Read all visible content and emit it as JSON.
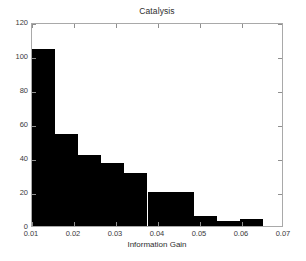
{
  "chart_data": {
    "type": "bar",
    "title": "Catalysis",
    "subtitle": "",
    "xlabel": "Information Gain",
    "ylabel": "",
    "grid": false,
    "legend": null,
    "legend_position": "none",
    "xlim": [
      0.01,
      0.07
    ],
    "ylim": [
      0,
      120
    ],
    "xticks": [
      0.01,
      0.02,
      0.03,
      0.04,
      0.05,
      0.06,
      0.07
    ],
    "xtick_labels": [
      "0.01",
      "0.02",
      "0.03",
      "0.04",
      "0.05",
      "0.06",
      "0.07"
    ],
    "yticks": [
      0,
      20,
      40,
      60,
      80,
      100,
      120
    ],
    "ytick_labels": [
      "0",
      "20",
      "40",
      "60",
      "80",
      "100",
      "120"
    ],
    "bar_color": "#000000",
    "axis_color": "#a9a9a9",
    "bin_width": 0.0055,
    "bin_edges": [
      0.01,
      0.0155,
      0.021,
      0.0265,
      0.032,
      0.0375,
      0.043,
      0.0485,
      0.054,
      0.0595,
      0.065
    ],
    "bin_centers": [
      0.01275,
      0.01825,
      0.02375,
      0.02925,
      0.03475,
      0.04025,
      0.04575,
      0.05125,
      0.05675,
      0.06225
    ],
    "values": [
      104,
      54,
      42,
      37,
      31,
      20,
      20,
      6,
      3,
      4
    ],
    "annotations": []
  }
}
